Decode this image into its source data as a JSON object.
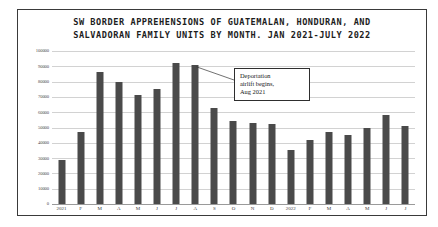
{
  "chart_data": {
    "type": "bar",
    "title": "SW BORDER APPREHENSIONS OF GUATEMALAN, HONDURAN, AND\nSALVADORAN FAMILY UNITS BY MONTH. JAN 2021-JULY 2022",
    "xlabel": "",
    "ylabel": "",
    "ylim": [
      0,
      100000
    ],
    "ytick_values": [
      0,
      10000,
      20000,
      30000,
      40000,
      50000,
      60000,
      70000,
      80000,
      90000,
      100000
    ],
    "ytick_labels": [
      "0",
      "10000",
      "20000",
      "30000",
      "40000",
      "50000",
      "60000",
      "70000",
      "80000",
      "90000",
      "100000"
    ],
    "grid": true,
    "legend": "none",
    "bar_color": "#4a4a4a",
    "categories": [
      "2021",
      "F",
      "M",
      "A",
      "M",
      "J",
      "J",
      "A",
      "S",
      "O",
      "N",
      "D",
      "2022",
      "F",
      "M",
      "A",
      "M",
      "J",
      "J"
    ],
    "values": [
      29000,
      47000,
      86000,
      80000,
      71000,
      75000,
      92000,
      91000,
      63000,
      54000,
      53000,
      52000,
      35000,
      42000,
      47000,
      45000,
      50000,
      58000,
      51000
    ],
    "annotations": [
      {
        "text": "Deportation\nairlift begins,\nAug 2021",
        "points_to_category": "A",
        "points_to_index": 7
      }
    ]
  },
  "frame": {
    "border_color": "#3a3a3a",
    "background": "#ffffff"
  }
}
